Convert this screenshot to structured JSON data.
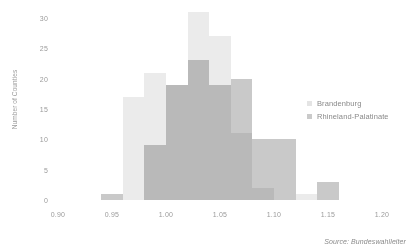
{
  "chart_data": {
    "type": "bar",
    "title": "",
    "subtitle": "",
    "xlabel": "",
    "ylabel": "Number of Counties",
    "xlim": [
      0.9,
      1.2
    ],
    "ylim": [
      0,
      30
    ],
    "grid": false,
    "bin_width": 0.02,
    "legend_position": "right",
    "xticks": [
      "0.90",
      "0.95",
      "1.00",
      "1.05",
      "1.10",
      "1.15",
      "1.20"
    ],
    "xtick_values": [
      0.9,
      0.95,
      1.0,
      1.05,
      1.1,
      1.15,
      1.2
    ],
    "yticks": [
      "0",
      "5",
      "10",
      "15",
      "20",
      "25",
      "30"
    ],
    "ytick_values": [
      0,
      5,
      10,
      15,
      20,
      25,
      30
    ],
    "bin_starts": [
      0.94,
      0.96,
      0.98,
      1.0,
      1.02,
      1.04,
      1.06,
      1.08,
      1.1,
      1.12,
      1.14
    ],
    "series": [
      {
        "name": "Brandenburg",
        "color": "#ebebeb",
        "values": [
          0,
          17,
          21,
          19,
          31,
          27,
          11,
          2,
          0,
          1,
          0
        ]
      },
      {
        "name": "Rhineland-Palatinate",
        "color": "#c9c9c9",
        "values": [
          1,
          0,
          9,
          19,
          23,
          19,
          20,
          10,
          10,
          0,
          3
        ]
      }
    ],
    "annotations": [
      {
        "name": "source",
        "text": "Source: Bundeswahlleiter"
      }
    ]
  },
  "legend": {
    "items": [
      {
        "label": "Brandenburg"
      },
      {
        "label": "Rhineland-Palatinate"
      }
    ]
  },
  "source": {
    "text": "Source: Bundeswahlleiter"
  }
}
